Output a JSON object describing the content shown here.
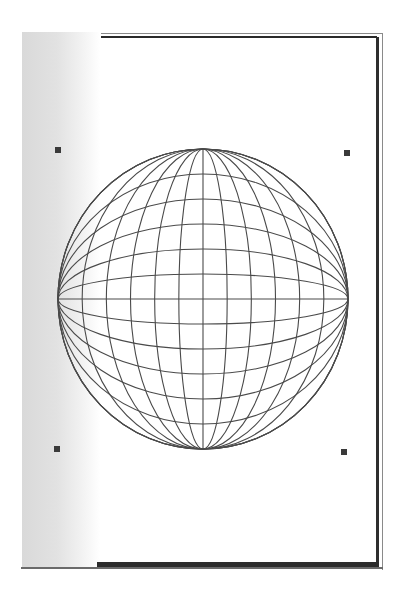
{
  "canvas": {
    "background": "#ffffff",
    "page_frame_color": "#2a2a2a",
    "left_strip_color": "#d9d9d9"
  },
  "selection_handles": [
    {
      "name": "top-left",
      "x": 55,
      "y": 147
    },
    {
      "name": "top-right",
      "x": 344,
      "y": 150
    },
    {
      "name": "bottom-left",
      "x": 54,
      "y": 446
    },
    {
      "name": "bottom-right",
      "x": 341,
      "y": 449
    }
  ],
  "sphere": {
    "shape": "wireframe-globe",
    "cx": 203,
    "cy": 299,
    "rx": 145,
    "ry": 150,
    "stroke": "#4a4a4a",
    "stroke_width": 1.1,
    "meridian_count": 13,
    "parallel_count": 13
  }
}
